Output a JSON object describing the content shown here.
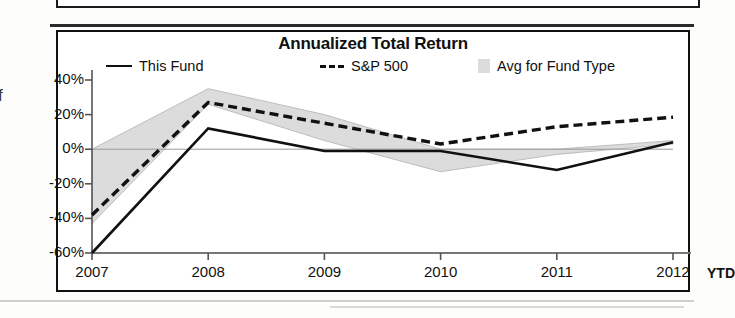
{
  "chart": {
    "title": "Annualized Total Return",
    "x_axis_suffix": "YTD"
  },
  "legend": [
    {
      "label": "This Fund",
      "marker": "solid-line-swatch"
    },
    {
      "label": "S&P 500",
      "marker": "dashed-line-swatch"
    },
    {
      "label": "Avg for Fund Type",
      "marker": "gray-box-swatch"
    }
  ],
  "chart_data": {
    "type": "line",
    "title": "Annualized Total Return",
    "xlabel": "",
    "ylabel": "",
    "categories": [
      "2007",
      "2008",
      "2009",
      "2010",
      "2011",
      "2012"
    ],
    "x_tick_labels": [
      "2007",
      "2008",
      "2009",
      "2010",
      "2011",
      "2012"
    ],
    "x_axis_note": "YTD",
    "y_tick_labels": [
      "40%",
      "20%",
      "0%",
      "-20%",
      "-40%",
      "-60%"
    ],
    "y_ticks": [
      40,
      20,
      0,
      -20,
      -40,
      -60
    ],
    "ylim": [
      -60,
      40
    ],
    "grid": false,
    "legend_position": "top",
    "series": [
      {
        "name": "This Fund",
        "style": "solid",
        "color": "#111111",
        "values": [
          -60,
          12,
          -1,
          -1,
          -12,
          4
        ]
      },
      {
        "name": "S&P 500",
        "style": "dashed",
        "color": "#111111",
        "values": [
          -38,
          27,
          15,
          3,
          13,
          18.5
        ]
      },
      {
        "name": "Avg for Fund Type",
        "style": "band",
        "color": "#dcdcdc",
        "upper": [
          0,
          35,
          20,
          0,
          0,
          5
        ],
        "lower": [
          -43,
          26,
          5,
          -13,
          -3,
          3
        ]
      }
    ]
  },
  "colors": {
    "line": "#111111",
    "band": "#dcdcdc",
    "frame": "#111111"
  }
}
